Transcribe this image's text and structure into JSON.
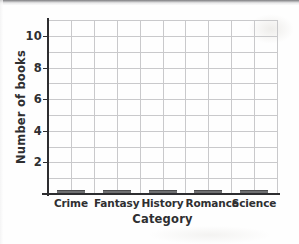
{
  "chart_data": {
    "type": "bar",
    "title": "",
    "xlabel": "Category",
    "ylabel": "Number of books",
    "categories": [
      "Crime",
      "Fantasy",
      "History",
      "Romance",
      "Science"
    ],
    "values": [
      0,
      0,
      0,
      0,
      0
    ],
    "ylim": [
      0,
      11
    ],
    "y_major_ticks": [
      2,
      4,
      6,
      8,
      10
    ],
    "y_tick_labels": [
      "2",
      "4",
      "6",
      "8",
      "10"
    ],
    "y_gridline_step": 1,
    "x_gridlines_per_category": 2,
    "grid": true,
    "legend": false,
    "colors": {
      "bar": "#6f7072",
      "bar_edge": "#4a4a4c",
      "axis": "#2d2d30",
      "grid": "#c9c9cb",
      "text": "#2f2f31",
      "background": "#fefefe"
    }
  }
}
